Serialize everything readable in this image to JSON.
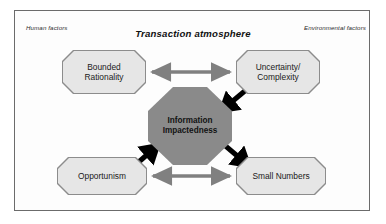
{
  "figure": {
    "title": "Transaction atmosphere",
    "corner_labels": {
      "left": "Human factors",
      "right": "Environmental factors"
    },
    "colors": {
      "frame_border": "#6b6b6b",
      "node_fill": "#e6e6e6",
      "node_border": "#8c8c8c",
      "center_fill": "#8a8a8a",
      "gray_arrow": "#808080",
      "black_arrow": "#000000",
      "background": "#ffffff",
      "text": "#1a1a1a"
    },
    "nodes": {
      "bounded_rationality": {
        "label_line1": "Bounded",
        "label_line2": "Rationality",
        "shape": "octagon"
      },
      "uncertainty_complexity": {
        "label_line1": "Uncertainty/",
        "label_line2": "Complexity",
        "shape": "octagon"
      },
      "opportunism": {
        "label_line1": "Opportunism",
        "shape": "octagon"
      },
      "small_numbers": {
        "label_line1": "Small Numbers",
        "shape": "octagon"
      },
      "information_impactedness": {
        "label_line1": "Information",
        "label_line2": "Impactedness",
        "shape": "octagon"
      }
    },
    "connections": [
      {
        "name": "bounded-rationality-to-uncertainty",
        "from": "Bounded Rationality",
        "to": "Uncertainty/Complexity",
        "style": "double-headed",
        "color": "#808080"
      },
      {
        "name": "uncertainty-to-information-impactedness",
        "from": "Uncertainty/Complexity",
        "to": "Information Impactedness",
        "style": "single-headed",
        "color": "#000000"
      },
      {
        "name": "opportunism-to-information-impactedness",
        "from": "Opportunism",
        "to": "Information Impactedness",
        "style": "single-headed",
        "color": "#000000"
      },
      {
        "name": "information-impactedness-to-small-numbers",
        "from": "Information Impactedness",
        "to": "Small Numbers",
        "style": "single-headed",
        "color": "#000000"
      },
      {
        "name": "opportunism-to-small-numbers",
        "from": "Opportunism",
        "to": "Small Numbers",
        "style": "double-headed",
        "color": "#808080"
      }
    ]
  }
}
